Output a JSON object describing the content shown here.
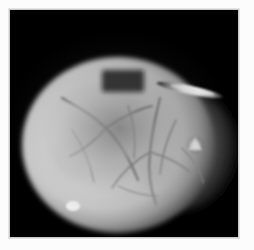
{
  "figure": {
    "name": "specimen-micrograph",
    "caption": "",
    "background_color": "#000000",
    "paper_color": "#fcfcfc",
    "frame_color": "#c9c9c9",
    "field": {
      "x": 10,
      "y": 10,
      "width": 228,
      "height": 227
    }
  },
  "specimen": {
    "label": "spherical-specimen",
    "description": "bright illuminated spherical body with surface vasculature",
    "highlight_color": "#fefefe",
    "body_color": "#f2f2f2",
    "midtone_color": "#bdbdbd",
    "shadow_color": "#2a2a2a",
    "vein_color": "#8d8d8d",
    "center_x": 108,
    "center_y": 135,
    "radius_x": 96,
    "radius_y": 88
  },
  "features": [
    {
      "name": "secondary-lobe",
      "description": "dimmer tissue lobe on right flank",
      "color": "#7a7a7a"
    },
    {
      "name": "instrument-specular-streak",
      "description": "elongated bright specular streak upper right",
      "color": "#f6f6f6"
    },
    {
      "name": "right-edge-highlight",
      "description": "small triangular bright reflection on right margin",
      "color": "#fafafa"
    },
    {
      "name": "lower-edge-highlight",
      "description": "small bright glint near lower left rim",
      "color": "#f8f8f8"
    },
    {
      "name": "apex-notch",
      "description": "faint dark rectangular notch at specimen apex",
      "color": "#1c1c1c"
    }
  ],
  "vasculature": {
    "label": "surface-vessel-network",
    "vessel_count": 11,
    "stroke_color": "#909090",
    "paths": [
      "M 52 88 C 66 96, 82 104, 96 118 C 110 132, 120 150, 128 170",
      "M 96 118 C 108 110, 124 100, 142 96",
      "M 96 118 C 88 128, 74 140, 60 146",
      "M 150 88 C 146 104, 142 122, 140 142 C 138 160, 140 178, 146 194",
      "M 140 142 C 154 146, 168 152, 180 162",
      "M 140 142 C 126 150, 112 162, 102 178",
      "M 166 110 C 158 126, 152 144, 150 164",
      "M 118 96 C 124 112, 126 130, 124 148",
      "M 62 120 C 72 134, 80 152, 84 172",
      "M 172 138 C 182 148, 190 160, 194 174",
      "M 108 176 C 120 182, 134 186, 148 186"
    ]
  }
}
